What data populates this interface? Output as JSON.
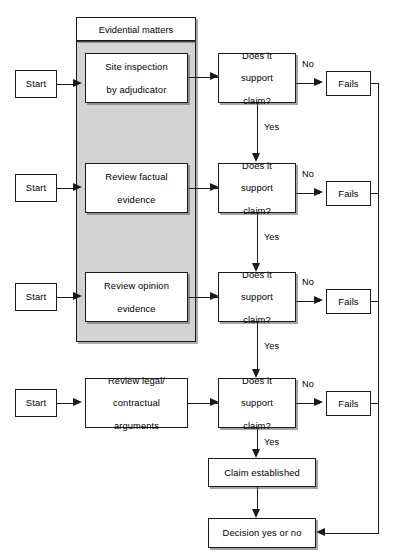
{
  "diagram": {
    "colors": {
      "panel_fill": "#d3d3d3",
      "node_fill": "#ffffff",
      "stroke": "#1a1a1a"
    },
    "group_panel": {
      "header_label": "Evidential matters"
    },
    "rows": [
      {
        "id": "row-1",
        "start_label": "Start",
        "process_label": "Site inspection\nby adjudicator",
        "process_line_1": "Site inspection",
        "process_line_2": "by adjudicator",
        "decision_line_1": "Does it",
        "decision_line_2": "support",
        "decision_line_3": "claim?",
        "no_label": "No",
        "yes_label": "Yes",
        "fail_label": "Fails"
      },
      {
        "id": "row-2",
        "start_label": "Start",
        "process_label": "Review factual\nevidence",
        "process_line_1": "Review factual",
        "process_line_2": "evidence",
        "decision_line_1": "Does it",
        "decision_line_2": "support",
        "decision_line_3": "claim?",
        "no_label": "No",
        "yes_label": "Yes",
        "fail_label": "Fails"
      },
      {
        "id": "row-3",
        "start_label": "Start",
        "process_label": "Review opinion\nevidence",
        "process_line_1": "Review opinion",
        "process_line_2": "evidence",
        "decision_line_1": "Does it",
        "decision_line_2": "support",
        "decision_line_3": "claim?",
        "no_label": "No",
        "yes_label": "Yes",
        "fail_label": "Fails"
      },
      {
        "id": "row-4",
        "start_label": "Start",
        "process_label": "Review legal/\ncontractual\narguments",
        "process_line_1": "Review legal/",
        "process_line_2": "contractual",
        "process_line_3": "arguments",
        "decision_line_1": "Does it",
        "decision_line_2": "support",
        "decision_line_3": "claim?",
        "no_label": "No",
        "yes_label": "Yes",
        "fail_label": "Fails"
      }
    ],
    "outcomes": {
      "claim_established": "Claim established",
      "decision": "Decision yes or no"
    }
  }
}
